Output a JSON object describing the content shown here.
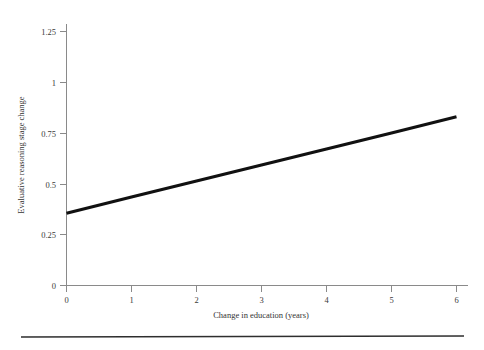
{
  "chart_data": {
    "type": "line",
    "title": "",
    "subtitle": "",
    "xlabel": "Change in education (years)",
    "ylabel": "Evaluative reasoning stage change",
    "xlim": [
      0,
      6
    ],
    "ylim": [
      0,
      1.25
    ],
    "xticks": [
      0,
      1,
      2,
      3,
      4,
      5,
      6
    ],
    "xtick_labels": [
      "0",
      "1",
      "2",
      "3",
      "4",
      "5",
      "6"
    ],
    "yticks": [
      0,
      0.25,
      0.5,
      0.75,
      1,
      1.25
    ],
    "ytick_labels": [
      "0",
      "0.25",
      "0.5",
      "0.75",
      "1",
      "1.25"
    ],
    "grid": false,
    "legend": null,
    "series": [
      {
        "name": "Evaluative reasoning stage change",
        "color": "#111111",
        "line_width": 3,
        "x": [
          0,
          1,
          2,
          3,
          4,
          5,
          6
        ],
        "values": [
          0.355,
          0.435,
          0.514,
          0.593,
          0.672,
          0.751,
          0.83
        ]
      }
    ],
    "annotations": []
  },
  "figure": {
    "background_color": "#ffffff",
    "axis_color": "#8a8a8a",
    "text_color": "#3a3a3a",
    "footer_rule_color": "#2e2e2e"
  }
}
